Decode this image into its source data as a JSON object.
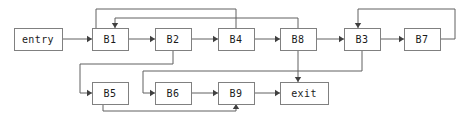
{
  "diagram": {
    "type": "control-flow-graph",
    "width": 468,
    "height": 118,
    "background_color": "#ffffff",
    "node_fill": "#ffffff",
    "node_stroke": "#808080",
    "edge_color": "#606060",
    "arrow_color": "#404040",
    "text_color": "#1a1a1a"
  },
  "nodes": [
    {
      "id": "entry",
      "label": "entry",
      "x": 14,
      "y": 28,
      "w": 48,
      "h": 22
    },
    {
      "id": "B1",
      "label": "B1",
      "x": 92,
      "y": 28,
      "w": 36,
      "h": 22
    },
    {
      "id": "B2",
      "label": "B2",
      "x": 155,
      "y": 28,
      "w": 36,
      "h": 22
    },
    {
      "id": "B4",
      "label": "B4",
      "x": 218,
      "y": 28,
      "w": 36,
      "h": 22
    },
    {
      "id": "B8",
      "label": "B8",
      "x": 280,
      "y": 28,
      "w": 36,
      "h": 22
    },
    {
      "id": "B3",
      "label": "B3",
      "x": 344,
      "y": 28,
      "w": 36,
      "h": 22
    },
    {
      "id": "B7",
      "label": "B7",
      "x": 404,
      "y": 28,
      "w": 36,
      "h": 22
    },
    {
      "id": "B5",
      "label": "B5",
      "x": 92,
      "y": 82,
      "w": 36,
      "h": 22
    },
    {
      "id": "B6",
      "label": "B6",
      "x": 155,
      "y": 82,
      "w": 36,
      "h": 22
    },
    {
      "id": "B9",
      "label": "B9",
      "x": 218,
      "y": 82,
      "w": 36,
      "h": 22
    },
    {
      "id": "exit",
      "label": "exit",
      "x": 280,
      "y": 82,
      "w": 48,
      "h": 22
    }
  ],
  "edges": [
    {
      "id": "entry-B1",
      "from": "entry",
      "to": "B1",
      "points": "62,39 92,39",
      "arrow": {
        "x": 92,
        "y": 39,
        "dir": "right"
      }
    },
    {
      "id": "B1-B2",
      "from": "B1",
      "to": "B2",
      "points": "128,39 155,39",
      "arrow": {
        "x": 155,
        "y": 39,
        "dir": "right"
      }
    },
    {
      "id": "B2-B4",
      "from": "B2",
      "to": "B4",
      "points": "191,39 218,39",
      "arrow": {
        "x": 218,
        "y": 39,
        "dir": "right"
      }
    },
    {
      "id": "B4-B8",
      "from": "B4",
      "to": "B8",
      "points": "254,39 280,39",
      "arrow": {
        "x": 280,
        "y": 39,
        "dir": "right"
      }
    },
    {
      "id": "B8-B3",
      "from": "B8",
      "to": "B3",
      "points": "316,39 344,39",
      "arrow": {
        "x": 344,
        "y": 39,
        "dir": "right"
      }
    },
    {
      "id": "B3-B7",
      "from": "B3",
      "to": "B7",
      "points": "380,39 404,39",
      "arrow": {
        "x": 404,
        "y": 39,
        "dir": "right"
      }
    },
    {
      "id": "B4-B1-back",
      "from": "B4",
      "to": "B1",
      "points": "236,28 236,9 96,9 96,28",
      "arrow": null
    },
    {
      "id": "B8-B1-back",
      "from": "B8",
      "to": "B1",
      "points": "298,28 298,18 115,18 115,28",
      "arrow": {
        "x": 115,
        "y": 28,
        "dir": "down"
      }
    },
    {
      "id": "B7-B3-back",
      "from": "B7",
      "to": "B3",
      "points": "440,39 455,39 455,9 358,9 358,28",
      "arrow": {
        "x": 358,
        "y": 28,
        "dir": "down"
      }
    },
    {
      "id": "B2-B5",
      "from": "B2",
      "to": "B5",
      "points": "173,50 173,64 80,64 80,93 92,93",
      "arrow": {
        "x": 92,
        "y": 93,
        "dir": "right"
      }
    },
    {
      "id": "B3-B6",
      "from": "B3",
      "to": "B6",
      "points": "362,50 362,71 143,71 143,93 155,93",
      "arrow": {
        "x": 155,
        "y": 93,
        "dir": "right"
      }
    },
    {
      "id": "B5-B9-back",
      "from": "B5",
      "to": "B9",
      "points": "103,104 103,111 236,111 236,104",
      "arrow": {
        "x": 236,
        "y": 104,
        "dir": "up"
      }
    },
    {
      "id": "B6-B9",
      "from": "B6",
      "to": "B9",
      "points": "191,93 218,93",
      "arrow": {
        "x": 218,
        "y": 93,
        "dir": "right"
      }
    },
    {
      "id": "B9-exit",
      "from": "B9",
      "to": "exit",
      "points": "254,93 280,93",
      "arrow": {
        "x": 280,
        "y": 93,
        "dir": "right"
      }
    },
    {
      "id": "B8-exit",
      "from": "B8",
      "to": "exit",
      "points": "298,50 298,82",
      "arrow": {
        "x": 298,
        "y": 82,
        "dir": "down"
      }
    }
  ]
}
